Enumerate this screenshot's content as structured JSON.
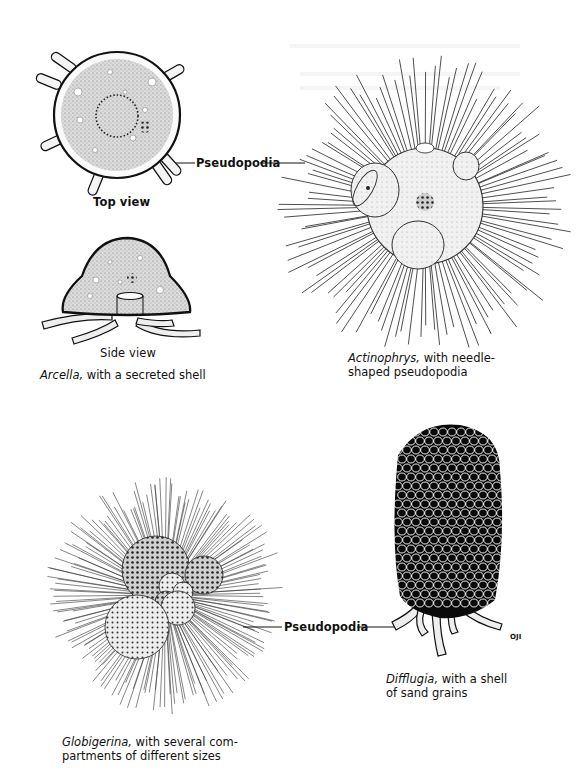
{
  "page": {
    "type": "book-illustration-page",
    "figure": {
      "panels": [
        {
          "id": "arcella",
          "views": [
            {
              "label": "Top view"
            },
            {
              "label": "Side view"
            }
          ],
          "caption_italic": "Arcella,",
          "caption_rest": " with a secreted shell"
        },
        {
          "id": "actinophrys",
          "caption_italic": "Actinophrys,",
          "caption_rest": " with needle-",
          "caption_line2": "shaped pseudopodia"
        },
        {
          "id": "globigerina",
          "caption_italic": "Globigerina,",
          "caption_rest": " with several com-",
          "caption_line2": "partments of different sizes"
        },
        {
          "id": "difflugia",
          "caption_italic": "Difflugia,",
          "caption_rest": " with a shell",
          "caption_line2": "of sand grains",
          "signature": "OJI"
        }
      ],
      "callouts": [
        {
          "label": "Pseudopodia"
        },
        {
          "label": "Pseudopodia"
        }
      ]
    }
  }
}
